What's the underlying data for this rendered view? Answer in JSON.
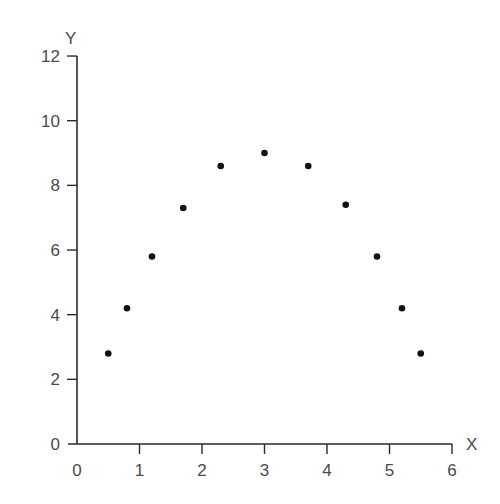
{
  "chart_data": {
    "type": "scatter",
    "title": "",
    "xlabel": "X",
    "ylabel": "Y",
    "xlim": [
      0,
      6
    ],
    "ylim": [
      0,
      12
    ],
    "grid": false,
    "legend": null,
    "x_ticks": [
      0,
      1,
      2,
      3,
      4,
      5,
      6
    ],
    "y_ticks": [
      0,
      2,
      4,
      6,
      8,
      10,
      12
    ],
    "series": [
      {
        "name": "points",
        "color": "#111111",
        "x": [
          0.5,
          0.8,
          1.2,
          1.7,
          2.3,
          3.0,
          3.7,
          4.3,
          4.8,
          5.2,
          5.5
        ],
        "y": [
          2.8,
          4.2,
          5.8,
          7.3,
          8.6,
          9.0,
          8.6,
          7.4,
          5.8,
          4.2,
          2.8
        ]
      }
    ]
  },
  "layout": {
    "origin_px": [
      77,
      444
    ],
    "x_px_per_unit": 62.5,
    "y_px_per_unit": 32.33
  }
}
